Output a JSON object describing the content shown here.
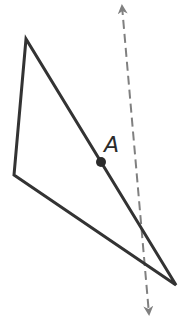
{
  "diagram": {
    "triangle": {
      "vertices": [
        [
          26,
          39
        ],
        [
          14,
          175
        ],
        [
          176,
          285
        ]
      ],
      "stroke": "#333333"
    },
    "point": {
      "label": "A",
      "x": 101,
      "y": 162,
      "color": "#2b2b2b"
    },
    "line": {
      "style": "dashed",
      "from": [
        122,
        6
      ],
      "to": [
        149,
        314
      ],
      "arrows": "both",
      "color": "#808080"
    }
  }
}
